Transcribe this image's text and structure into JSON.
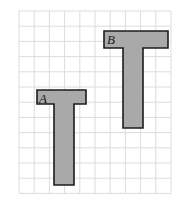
{
  "figure": {
    "width": 188,
    "height": 210,
    "background_color": "#ffffff"
  },
  "grid": {
    "visible": true,
    "line_color": "#d8dde4",
    "line_width": 1,
    "cell_size": 15.2,
    "origin_x": 19,
    "origin_y": 11,
    "columns": 10,
    "rows": 12,
    "right_edge": 171,
    "bottom_edge": 193
  },
  "style": {
    "fill_color": "#a9a9a9",
    "stroke_color": "#1c1c1c",
    "stroke_width": 1.6,
    "label_color": "#1a1a1a"
  },
  "shapes": [
    {
      "id": "shape-a",
      "label": "A",
      "label_x": 39,
      "label_y": 92,
      "outline_points": "37,90 86,90 86,104 74,104 74,185 54,185 54,104 37,104",
      "bar": {
        "x": 37,
        "y": 90,
        "width": 49,
        "height": 14
      },
      "stem": {
        "x": 54,
        "y": 104,
        "width": 20,
        "height": 81
      }
    },
    {
      "id": "shape-b",
      "label": "B",
      "label_x": 107,
      "label_y": 33,
      "outline_points": "104,31 168,31 168,48 143,48 143,128 123,128 123,48 104,48",
      "bar": {
        "x": 104,
        "y": 31,
        "width": 64,
        "height": 17
      },
      "stem": {
        "x": 123,
        "y": 48,
        "width": 20,
        "height": 80
      }
    }
  ]
}
